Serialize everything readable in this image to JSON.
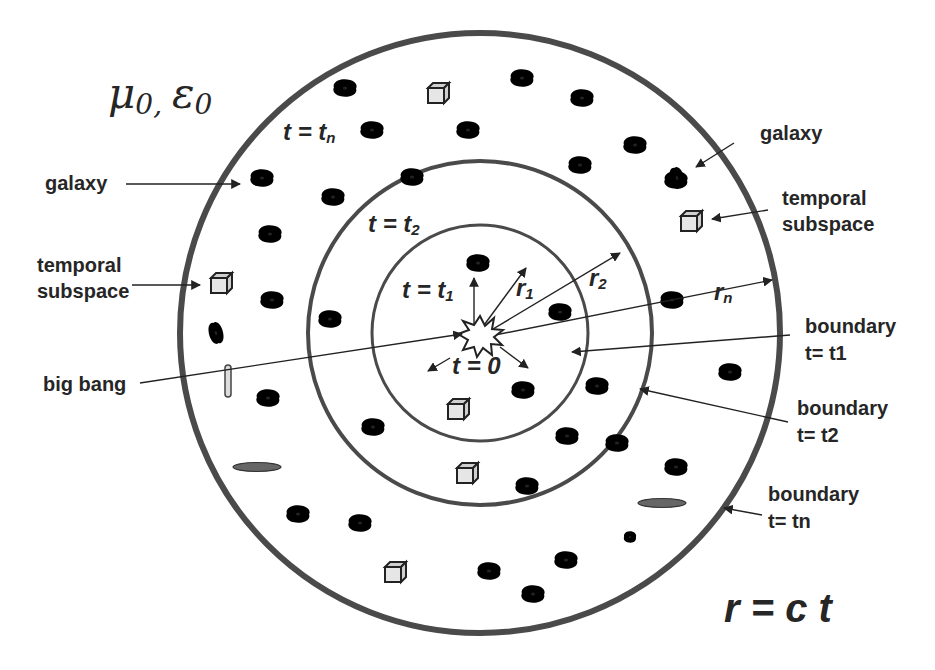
{
  "diagram": {
    "medium_label": "μ0, ε0",
    "medium_symbols": {
      "mu": "μ",
      "epsilon": "ε",
      "subscript": "0"
    },
    "equation": "r = c t",
    "center": {
      "x": 480,
      "y": 333
    },
    "rings": [
      {
        "id": "t1",
        "radius": 108,
        "stroke_width": 3,
        "label": "t = t1",
        "label_main": "t = t",
        "label_sub": "1",
        "radius_label": "r",
        "radius_sub": "1"
      },
      {
        "id": "t2",
        "radius": 172,
        "stroke_width": 4,
        "label": "t = t2",
        "label_main": "t = t",
        "label_sub": "2",
        "radius_label": "r",
        "radius_sub": "2"
      },
      {
        "id": "tn",
        "radius": 300,
        "stroke_width": 6,
        "label": "t = tn",
        "label_main": "t = t",
        "label_sub": "n",
        "radius_label": "r",
        "radius_sub": "n"
      }
    ],
    "center_label": "t = 0",
    "annotations": [
      {
        "id": "galaxy-left",
        "text": "galaxy",
        "x": 45,
        "y": 190
      },
      {
        "id": "temporal-subspace-left",
        "lines": [
          "temporal",
          "subspace"
        ],
        "x": 37,
        "y": 272
      },
      {
        "id": "big-bang",
        "text": "big bang",
        "x": 43,
        "y": 390
      },
      {
        "id": "galaxy-right",
        "text": "galaxy",
        "x": 760,
        "y": 140
      },
      {
        "id": "temporal-subspace-right",
        "lines": [
          "temporal",
          "subspace"
        ],
        "x": 782,
        "y": 210
      },
      {
        "id": "boundary-t1",
        "lines": [
          "boundary",
          "t= t1"
        ],
        "x": 805,
        "y": 330
      },
      {
        "id": "boundary-t2",
        "lines": [
          "boundary",
          "t= t2"
        ],
        "x": 797,
        "y": 415
      },
      {
        "id": "boundary-tn",
        "lines": [
          "boundary",
          "t= tn"
        ],
        "x": 768,
        "y": 502
      }
    ],
    "legend_terms": {
      "galaxy": "galaxy",
      "temporal_subspace": "temporal subspace",
      "big_bang": "big bang",
      "boundary": "boundary"
    },
    "galaxies": [
      [
        345,
        88
      ],
      [
        522,
        78
      ],
      [
        582,
        98
      ],
      [
        372,
        130
      ],
      [
        468,
        130
      ],
      [
        580,
        165
      ],
      [
        635,
        145
      ],
      [
        262,
        178
      ],
      [
        333,
        197
      ],
      [
        412,
        177
      ],
      [
        676,
        180
      ],
      [
        270,
        234
      ],
      [
        478,
        263
      ],
      [
        272,
        300
      ],
      [
        330,
        319
      ],
      [
        560,
        312
      ],
      [
        672,
        300
      ],
      [
        730,
        372
      ],
      [
        268,
        398
      ],
      [
        523,
        390
      ],
      [
        597,
        386
      ],
      [
        373,
        427
      ],
      [
        617,
        443
      ],
      [
        567,
        436
      ],
      [
        298,
        514
      ],
      [
        527,
        486
      ],
      [
        676,
        467
      ],
      [
        360,
        523
      ],
      [
        566,
        560
      ],
      [
        489,
        571
      ],
      [
        533,
        594
      ]
    ],
    "tilted_galaxies": [
      [
        216,
        333
      ],
      [
        677,
        178
      ]
    ],
    "edge_on_galaxies": [
      [
        228,
        381
      ]
    ],
    "disk_galaxies": [
      [
        257,
        467
      ],
      [
        662,
        503
      ]
    ],
    "small_spiral": [
      [
        630,
        537
      ]
    ],
    "cubes": [
      [
        437,
        94
      ],
      [
        690,
        222
      ],
      [
        220,
        284
      ],
      [
        457,
        410
      ],
      [
        466,
        474
      ],
      [
        394,
        573
      ]
    ],
    "colors": {
      "ring": "#4a4a4a",
      "text": "#262626",
      "cube_fill": "#e6e6e6",
      "background": "#ffffff"
    }
  }
}
